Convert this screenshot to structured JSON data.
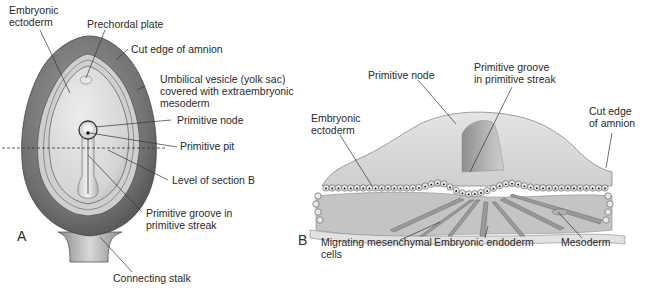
{
  "figure": {
    "panel_a": {
      "letter": "A",
      "labels": {
        "embryonic_ectoderm": "Embryonic\nectoderm",
        "prechordal_plate": "Prechordal plate",
        "cut_edge_amnion": "Cut edge of amnion",
        "umbilical_vesicle": "Umbilical vesicle (yolk sac)\ncovered with extraembryonic\nmesoderm",
        "primitive_node": "Primitive node",
        "primitive_pit": "Primitive pit",
        "level_section_b": "Level of section B",
        "primitive_groove": "Primitive groove in\nprimitive streak",
        "connecting_stalk": "Connecting stalk"
      }
    },
    "panel_b": {
      "letter": "B",
      "labels": {
        "primitive_node": "Primitive node",
        "primitive_groove": "Primitive groove\nin primitive streak",
        "embryonic_ectoderm": "Embryonic\nectoderm",
        "cut_edge_amnion": "Cut edge\nof amnion",
        "migrating_cells": "Migrating mesenchymal\ncells",
        "embryonic_endoderm": "Embryonic endoderm",
        "mesoderm": "Mesoderm"
      }
    },
    "colors": {
      "yolk_sac_dark": "#6f6f6f",
      "amnion_ring": "#c8c8c8",
      "disc_light": "#d9d9d9",
      "leader_line": "#333333",
      "cell": "#e6e6e6"
    }
  }
}
